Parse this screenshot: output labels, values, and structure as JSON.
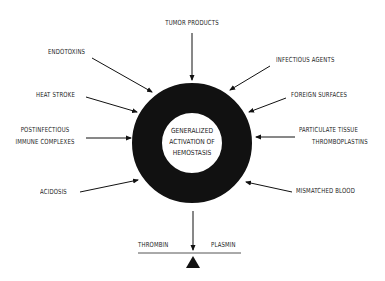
{
  "center": {
    "lines": [
      "GENERALIZED",
      "ACTIVATION OF",
      "HEMOSTASIS"
    ]
  },
  "causes": {
    "tumor_products": "TUMOR PRODUCTS",
    "endotoxins": "ENDOTOXINS",
    "infectious_agents": "INFECTIOUS AGENTS",
    "heat_stroke": "HEAT STROKE",
    "foreign_surfaces": "FOREIGN SURFACES",
    "postinfectious_1": "POSTINFECTIOUS",
    "postinfectious_2": "IMMUNE COMPLEXES",
    "particulate_1": "PARTICULATE TISSUE",
    "particulate_2": "THROMBOPLASTINS",
    "acidosis": "ACIDOSIS",
    "mismatched_blood": "MISMATCHED BLOOD"
  },
  "balance": {
    "left": "THROMBIN",
    "right": "PLASMIN"
  },
  "colors": {
    "ink": "#111111",
    "background": "#ffffff"
  }
}
